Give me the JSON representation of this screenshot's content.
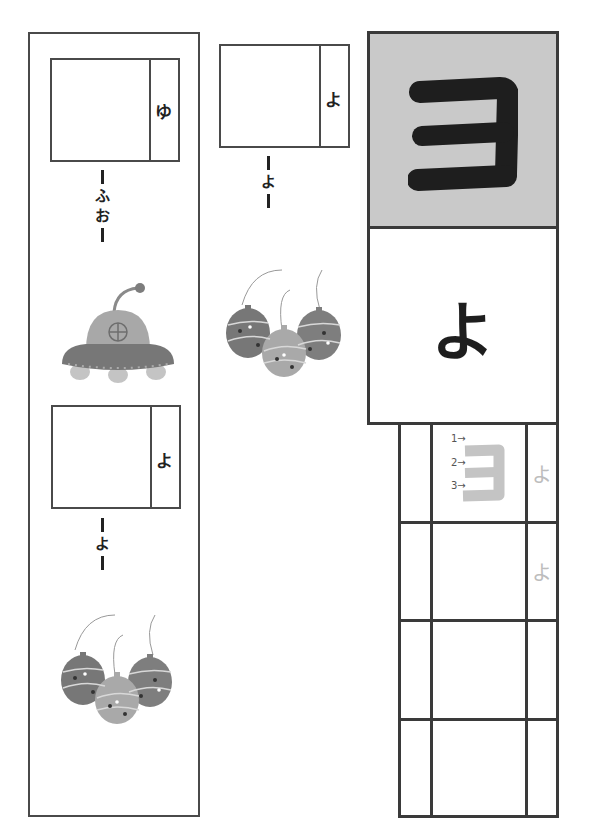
{
  "worksheet": {
    "cards": [
      {
        "id": "card-yu",
        "side_kana": "ゆ",
        "reading": [
          "ふ",
          "お"
        ],
        "illustration": "ufo"
      },
      {
        "id": "card-yo-left",
        "side_kana": "よ",
        "reading": [
          "よ"
        ],
        "illustration": "yoyo-balloons"
      },
      {
        "id": "card-yo-middle",
        "side_kana": "よ",
        "reading": [
          "よ"
        ],
        "illustration": "yoyo-balloons"
      }
    ],
    "practice": {
      "katakana": "ヨ",
      "hiragana": "よ",
      "stroke_labels": [
        "1→",
        "2→",
        "3→"
      ],
      "trace_kana": [
        "よ",
        "よ"
      ],
      "colors": {
        "katakana_bg": "#c9c9c9",
        "ink": "#1e1e1e",
        "trace": "#bdbdbd"
      }
    }
  }
}
